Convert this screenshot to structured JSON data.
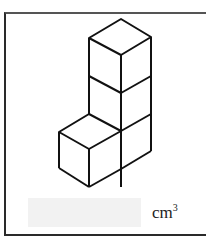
{
  "figure": {
    "cube_count": 4,
    "stroke_color": "#111111"
  },
  "answer": {
    "value": "",
    "unit": "cm",
    "unit_exponent": "3"
  }
}
